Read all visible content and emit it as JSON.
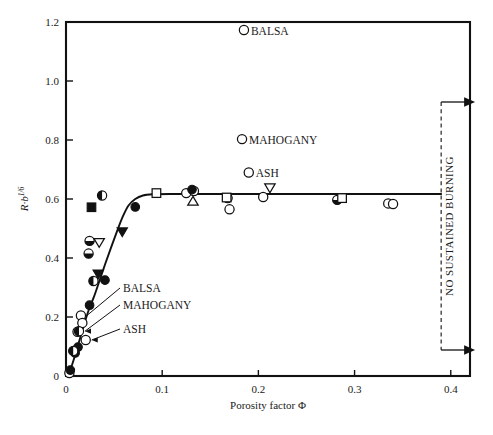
{
  "chart_data": {
    "type": "scatter",
    "title": "",
    "xlabel": "Porosity factor Φ",
    "ylabel": "R·b",
    "ylabel_exponent": "1/6",
    "xlim": [
      0,
      0.42
    ],
    "ylim": [
      0,
      1.2
    ],
    "xticks": [
      0,
      0.1,
      0.2,
      0.3,
      0.4
    ],
    "xtick_labels": [
      "0",
      "0.1",
      "0.2",
      "0.3",
      "0.4"
    ],
    "yticks": [
      0,
      0.2,
      0.4,
      0.6,
      0.8,
      1.0,
      1.2
    ],
    "ytick_labels": [
      "0",
      "0.2",
      "0.4",
      "0.6",
      "0.8",
      "1.0",
      "1.2"
    ],
    "grid": false,
    "legend": "none",
    "fit_curve": {
      "name": "fitted-curve",
      "points": [
        [
          0.003,
          0.005
        ],
        [
          0.008,
          0.055
        ],
        [
          0.013,
          0.11
        ],
        [
          0.018,
          0.165
        ],
        [
          0.023,
          0.218
        ],
        [
          0.029,
          0.268
        ],
        [
          0.035,
          0.325
        ],
        [
          0.041,
          0.382
        ],
        [
          0.047,
          0.437
        ],
        [
          0.053,
          0.49
        ],
        [
          0.059,
          0.54
        ],
        [
          0.065,
          0.578
        ],
        [
          0.072,
          0.6
        ],
        [
          0.08,
          0.612
        ],
        [
          0.09,
          0.616
        ],
        [
          0.11,
          0.617
        ],
        [
          0.15,
          0.617
        ],
        [
          0.2,
          0.617
        ],
        [
          0.25,
          0.617
        ],
        [
          0.3,
          0.617
        ],
        [
          0.35,
          0.617
        ],
        [
          0.39,
          0.617
        ]
      ]
    },
    "series": [
      {
        "name": "open-circle",
        "marker": "open-circle",
        "points": [
          [
            0.0035,
            0.01
          ],
          [
            0.012,
            0.15
          ],
          [
            0.0155,
            0.205
          ],
          [
            0.017,
            0.18
          ],
          [
            0.0205,
            0.122
          ],
          [
            0.125,
            0.62
          ],
          [
            0.133,
            0.627
          ],
          [
            0.168,
            0.603
          ],
          [
            0.17,
            0.565
          ],
          [
            0.185,
            1.173
          ],
          [
            0.183,
            0.803
          ],
          [
            0.19,
            0.69
          ],
          [
            0.205,
            0.607
          ],
          [
            0.335,
            0.585
          ],
          [
            0.34,
            0.583
          ]
        ]
      },
      {
        "name": "filled-circle",
        "marker": "filled-circle",
        "points": [
          [
            0.0045,
            0.02
          ],
          [
            0.0095,
            0.078
          ],
          [
            0.0125,
            0.098
          ],
          [
            0.0245,
            0.24
          ],
          [
            0.0405,
            0.325
          ],
          [
            0.072,
            0.573
          ],
          [
            0.131,
            0.632
          ]
        ]
      },
      {
        "name": "half-circle-left",
        "marker": "half-circle-left",
        "points": [
          [
            0.0075,
            0.085
          ],
          [
            0.0135,
            0.152
          ],
          [
            0.0285,
            0.322
          ],
          [
            0.0375,
            0.612
          ]
        ]
      },
      {
        "name": "half-circle-bottom",
        "marker": "half-circle-bottom",
        "points": [
          [
            0.0235,
            0.415
          ],
          [
            0.0245,
            0.458
          ],
          [
            0.282,
            0.597
          ]
        ]
      },
      {
        "name": "filled-square",
        "marker": "filled-square",
        "points": [
          [
            0.0265,
            0.572
          ]
        ]
      },
      {
        "name": "open-square",
        "marker": "open-square",
        "points": [
          [
            0.094,
            0.62
          ],
          [
            0.167,
            0.605
          ],
          [
            0.287,
            0.603
          ]
        ]
      },
      {
        "name": "filled-triangle-down",
        "marker": "filled-triangle-down",
        "points": [
          [
            0.0335,
            0.345
          ],
          [
            0.0585,
            0.488
          ]
        ]
      },
      {
        "name": "open-triangle-down",
        "marker": "open-triangle-down",
        "points": [
          [
            0.0345,
            0.452
          ],
          [
            0.212,
            0.637
          ]
        ]
      },
      {
        "name": "open-triangle-up",
        "marker": "open-triangle-up",
        "points": [
          [
            0.132,
            0.593
          ]
        ]
      }
    ],
    "point_annotations": [
      {
        "name": "balsa-top",
        "text": "BALSA",
        "x": 0.185,
        "y": 1.173,
        "placement": "right"
      },
      {
        "name": "mahogany-top",
        "text": "MAHOGANY",
        "x": 0.183,
        "y": 0.803,
        "placement": "right"
      },
      {
        "name": "ash-top",
        "text": "ASH",
        "x": 0.19,
        "y": 0.69,
        "placement": "right"
      }
    ],
    "leader_annotations": [
      {
        "name": "balsa-leader",
        "text": "BALSA",
        "target_x": 0.0155,
        "target_y": 0.205
      },
      {
        "name": "mahogany-leader",
        "text": "MAHOGANY",
        "target_x": 0.0135,
        "target_y": 0.152
      },
      {
        "name": "ash-leader",
        "text": "ASH",
        "target_x": 0.0205,
        "target_y": 0.122
      }
    ],
    "region_marker": {
      "name": "no-sustained-burning",
      "text": "NO  SUSTAINED  BURNING",
      "x": 0.39,
      "line_style": "dashed",
      "arrows": [
        "top-right",
        "bottom-right"
      ]
    }
  }
}
